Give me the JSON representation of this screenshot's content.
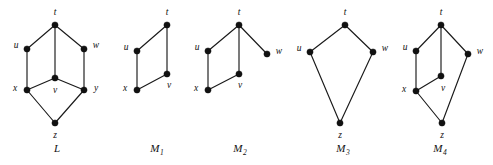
{
  "figure": {
    "background_color": "#ffffff",
    "ink_color": "#111111",
    "width": 493,
    "height": 165
  },
  "graphs": [
    {
      "id": "L",
      "caption": "L",
      "caption_base": "L",
      "caption_sub": "",
      "caption_x": 57,
      "caption_y": 152,
      "vertices": [
        {
          "id": "t",
          "label": "t",
          "x": 55,
          "y": 25,
          "lx": 55,
          "ly": 13,
          "anchor": "middle"
        },
        {
          "id": "u",
          "label": "u",
          "x": 27,
          "y": 49,
          "lx": 16,
          "ly": 46,
          "anchor": "middle"
        },
        {
          "id": "w",
          "label": "w",
          "x": 84,
          "y": 49,
          "lx": 96,
          "ly": 46,
          "anchor": "middle"
        },
        {
          "id": "v",
          "label": "v",
          "x": 55,
          "y": 78,
          "lx": 55,
          "ly": 91,
          "anchor": "middle"
        },
        {
          "id": "x",
          "label": "x",
          "x": 27,
          "y": 90,
          "lx": 15,
          "ly": 89,
          "anchor": "middle"
        },
        {
          "id": "y",
          "label": "y",
          "x": 84,
          "y": 90,
          "lx": 96,
          "ly": 89,
          "anchor": "middle"
        },
        {
          "id": "z",
          "label": "z",
          "x": 55,
          "y": 123,
          "lx": 55,
          "ly": 136,
          "anchor": "middle"
        }
      ],
      "edges": [
        [
          "t",
          "u"
        ],
        [
          "t",
          "w"
        ],
        [
          "t",
          "v"
        ],
        [
          "u",
          "x"
        ],
        [
          "w",
          "y"
        ],
        [
          "v",
          "x"
        ],
        [
          "v",
          "y"
        ],
        [
          "x",
          "z"
        ],
        [
          "y",
          "z"
        ]
      ]
    },
    {
      "id": "M1",
      "caption": "M1",
      "caption_base": "M",
      "caption_sub": "1",
      "caption_x": 157,
      "caption_y": 152,
      "vertices": [
        {
          "id": "t",
          "label": "t",
          "x": 167,
          "y": 25,
          "lx": 167,
          "ly": 13,
          "anchor": "middle"
        },
        {
          "id": "u",
          "label": "u",
          "x": 137,
          "y": 51,
          "lx": 126,
          "ly": 48,
          "anchor": "middle"
        },
        {
          "id": "v",
          "label": "v",
          "x": 167,
          "y": 74,
          "lx": 169,
          "ly": 86,
          "anchor": "middle"
        },
        {
          "id": "x",
          "label": "x",
          "x": 137,
          "y": 90,
          "lx": 125,
          "ly": 89,
          "anchor": "middle"
        }
      ],
      "edges": [
        [
          "t",
          "u"
        ],
        [
          "t",
          "v"
        ],
        [
          "u",
          "x"
        ],
        [
          "x",
          "v"
        ]
      ]
    },
    {
      "id": "M2",
      "caption": "M2",
      "caption_base": "M",
      "caption_sub": "2",
      "caption_x": 240,
      "caption_y": 152,
      "vertices": [
        {
          "id": "t",
          "label": "t",
          "x": 239,
          "y": 25,
          "lx": 239,
          "ly": 13,
          "anchor": "middle"
        },
        {
          "id": "u",
          "label": "u",
          "x": 208,
          "y": 51,
          "lx": 197,
          "ly": 48,
          "anchor": "middle"
        },
        {
          "id": "w",
          "label": "w",
          "x": 267,
          "y": 54,
          "lx": 279,
          "ly": 52,
          "anchor": "middle"
        },
        {
          "id": "v",
          "label": "v",
          "x": 239,
          "y": 74,
          "lx": 240,
          "ly": 86,
          "anchor": "middle"
        },
        {
          "id": "x",
          "label": "x",
          "x": 208,
          "y": 90,
          "lx": 196,
          "ly": 89,
          "anchor": "middle"
        }
      ],
      "edges": [
        [
          "t",
          "u"
        ],
        [
          "t",
          "v"
        ],
        [
          "t",
          "w"
        ],
        [
          "u",
          "x"
        ],
        [
          "x",
          "v"
        ]
      ]
    },
    {
      "id": "M3",
      "caption": "M3",
      "caption_base": "M",
      "caption_sub": "3",
      "caption_x": 343,
      "caption_y": 152,
      "vertices": [
        {
          "id": "t",
          "label": "t",
          "x": 345,
          "y": 25,
          "lx": 345,
          "ly": 13,
          "anchor": "middle"
        },
        {
          "id": "u",
          "label": "u",
          "x": 310,
          "y": 52,
          "lx": 299,
          "ly": 49,
          "anchor": "middle"
        },
        {
          "id": "w",
          "label": "w",
          "x": 373,
          "y": 52,
          "lx": 385,
          "ly": 49,
          "anchor": "middle"
        },
        {
          "id": "z",
          "label": "z",
          "x": 340,
          "y": 123,
          "lx": 340,
          "ly": 136,
          "anchor": "middle"
        }
      ],
      "edges": [
        [
          "t",
          "u"
        ],
        [
          "t",
          "w"
        ],
        [
          "u",
          "z"
        ],
        [
          "w",
          "z"
        ]
      ]
    },
    {
      "id": "M4",
      "caption": "M4",
      "caption_base": "M",
      "caption_sub": "4",
      "caption_x": 440,
      "caption_y": 152,
      "vertices": [
        {
          "id": "t",
          "label": "t",
          "x": 441,
          "y": 25,
          "lx": 441,
          "ly": 13,
          "anchor": "middle"
        },
        {
          "id": "u",
          "label": "u",
          "x": 416,
          "y": 51,
          "lx": 405,
          "ly": 48,
          "anchor": "middle"
        },
        {
          "id": "w",
          "label": "w",
          "x": 468,
          "y": 54,
          "lx": 480,
          "ly": 52,
          "anchor": "middle"
        },
        {
          "id": "v",
          "label": "v",
          "x": 441,
          "y": 76,
          "lx": 443,
          "ly": 89,
          "anchor": "middle"
        },
        {
          "id": "x",
          "label": "x",
          "x": 416,
          "y": 91,
          "lx": 404,
          "ly": 90,
          "anchor": "middle"
        },
        {
          "id": "z",
          "label": "z",
          "x": 442,
          "y": 123,
          "lx": 442,
          "ly": 136,
          "anchor": "middle"
        }
      ],
      "edges": [
        [
          "t",
          "u"
        ],
        [
          "t",
          "v"
        ],
        [
          "t",
          "w"
        ],
        [
          "u",
          "x"
        ],
        [
          "x",
          "v"
        ],
        [
          "x",
          "z"
        ],
        [
          "w",
          "z"
        ]
      ]
    }
  ]
}
